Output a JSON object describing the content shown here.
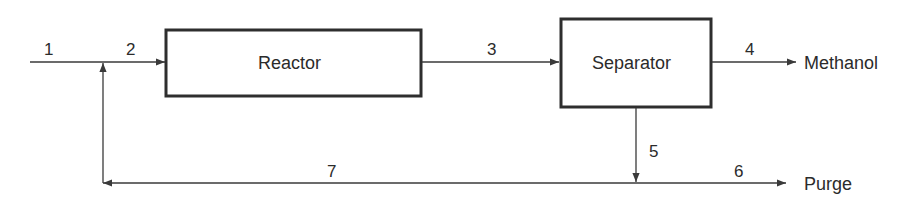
{
  "diagram": {
    "type": "process-flow",
    "colors": {
      "line": "#3a3a3a",
      "box_border": "#2e2e2e",
      "text": "#2b2b2b",
      "background": "#ffffff"
    },
    "units": [
      {
        "id": "reactor",
        "label": "Reactor"
      },
      {
        "id": "separator",
        "label": "Separator"
      }
    ],
    "streams": [
      {
        "id": "1",
        "label": "1",
        "from": "feed",
        "to": "mixer"
      },
      {
        "id": "2",
        "label": "2",
        "from": "mixer",
        "to": "reactor"
      },
      {
        "id": "3",
        "label": "3",
        "from": "reactor",
        "to": "separator"
      },
      {
        "id": "4",
        "label": "4",
        "from": "separator",
        "to": "product"
      },
      {
        "id": "5",
        "label": "5",
        "from": "separator",
        "to": "splitter"
      },
      {
        "id": "6",
        "label": "6",
        "from": "splitter",
        "to": "purge"
      },
      {
        "id": "7",
        "label": "7",
        "from": "splitter",
        "to": "mixer"
      }
    ],
    "outputs": {
      "product": "Methanol",
      "purge": "Purge"
    }
  }
}
